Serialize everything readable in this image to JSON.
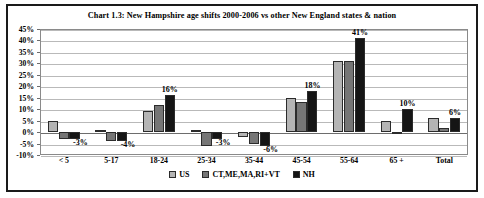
{
  "chart_data": {
    "type": "bar",
    "title": "Chart 1.3: New Hampshire age shifts 2000-2006 vs other New England states & nation",
    "xlabel": "",
    "ylabel": "",
    "ylim": [
      -10,
      45
    ],
    "ytick_step": 5,
    "grid": true,
    "legend_position": "bottom",
    "categories": [
      "< 5",
      "5-17",
      "18-24",
      "25-34",
      "35-44",
      "45-54",
      "55-64",
      "65 +",
      "Total"
    ],
    "series": [
      {
        "name": "US",
        "color": "#b4b4b4",
        "values": [
          5,
          1,
          9,
          1,
          -2,
          15,
          31,
          5,
          6
        ]
      },
      {
        "name": "CT,ME,MA,RI+VT",
        "color": "#767676",
        "values": [
          -3,
          -4,
          12,
          -6,
          -5,
          13,
          31,
          0,
          2
        ]
      },
      {
        "name": "NH",
        "color": "#151515",
        "values": [
          -3,
          -4,
          16,
          -3,
          -6,
          18,
          41,
          10,
          6
        ]
      }
    ],
    "ytick_labels": [
      "45%",
      "40%",
      "35%",
      "30%",
      "25%",
      "20%",
      "15%",
      "10%",
      "5%",
      "0%",
      "-5%",
      "-10%"
    ],
    "annotations": [
      {
        "category": "< 5",
        "text": "-3%",
        "value": -3
      },
      {
        "category": "5-17",
        "text": "-4%",
        "value": -4
      },
      {
        "category": "18-24",
        "text": "16%",
        "value": 16
      },
      {
        "category": "25-34",
        "text": "-3%",
        "value": -3
      },
      {
        "category": "35-44",
        "text": "-6%",
        "value": -6
      },
      {
        "category": "45-54",
        "text": "18%",
        "value": 18
      },
      {
        "category": "55-64",
        "text": "41%",
        "value": 41
      },
      {
        "category": "65 +",
        "text": "10%",
        "value": 10
      },
      {
        "category": "Total",
        "text": "6%",
        "value": 6
      }
    ]
  }
}
